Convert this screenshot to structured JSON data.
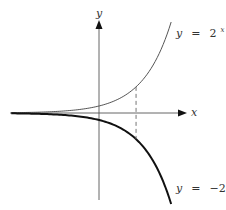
{
  "axes": {
    "x_label": "x",
    "y_label": "y"
  },
  "labels": {
    "upper": {
      "lhs": "y",
      "eq": "=",
      "base": "2",
      "exp": "x"
    },
    "lower": {
      "lhs": "y",
      "eq": "=",
      "base": "−2",
      "exp": "x"
    }
  },
  "colors": {
    "axis": "#555555",
    "upper_curve": "#555555",
    "lower_curve": "#111111",
    "dashed": "#666666",
    "text": "#333333"
  },
  "chart_data": {
    "type": "line",
    "title": "",
    "xlabel": "x",
    "ylabel": "y",
    "grid": false,
    "legend": "inline labels at right end of curves",
    "xlim": [
      -4.6,
      4.5
    ],
    "ylim": [
      -12.4,
      13.3
    ],
    "series": [
      {
        "name": "y = 2^x",
        "x": [
          -4.5,
          -3,
          -2,
          -1,
          0,
          1,
          1.9,
          2.5,
          3,
          3.7
        ],
        "values": [
          0.044,
          0.125,
          0.25,
          0.5,
          1,
          2,
          3.73,
          5.66,
          8,
          13
        ]
      },
      {
        "name": "y = -2^x",
        "x": [
          -4.5,
          -3,
          -2,
          -1,
          0,
          1,
          1.9,
          2.5,
          3,
          3.7
        ],
        "values": [
          -0.044,
          -0.125,
          -0.25,
          -0.5,
          -1,
          -2,
          -3.73,
          -5.66,
          -8,
          -13
        ]
      }
    ],
    "annotations": [
      {
        "type": "dashed-vertical",
        "x": 1.9,
        "from_y": -3.73,
        "to_y": 3.73,
        "note": "vertical dashed segment connecting the two curves (reflection in x-axis)"
      }
    ]
  }
}
